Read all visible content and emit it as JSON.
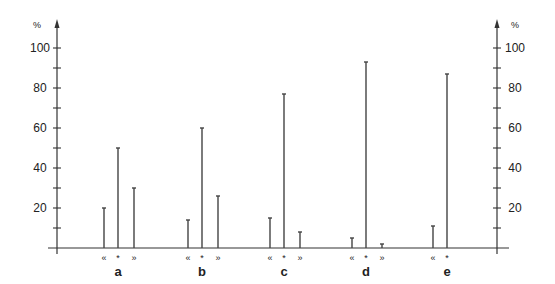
{
  "chart_data": {
    "type": "bar",
    "title": "",
    "xlabel": "",
    "ylabel": "%",
    "ylabel_right": "%",
    "ylim": [
      0,
      100
    ],
    "yticks_labeled": [
      20,
      40,
      60,
      80,
      100
    ],
    "yticks_minor": [
      10,
      30,
      50,
      70,
      90
    ],
    "grid": false,
    "legend": "none",
    "categories": [
      "a",
      "b",
      "c",
      "d",
      "e"
    ],
    "subcategory_markers": [
      "«",
      "*",
      "»"
    ],
    "series": [
      {
        "name": "«",
        "values": [
          20,
          14,
          15,
          5,
          11
        ]
      },
      {
        "name": "*",
        "values": [
          50,
          60,
          77,
          93,
          87
        ]
      },
      {
        "name": "»",
        "values": [
          30,
          26,
          8,
          2,
          null
        ]
      }
    ]
  },
  "axis": {
    "left_unit": "%",
    "right_unit": "%",
    "tick_labels": [
      "20",
      "40",
      "60",
      "80",
      "100"
    ]
  },
  "groups": [
    {
      "label": "a",
      "markers": [
        "«",
        "*",
        "»"
      ]
    },
    {
      "label": "b",
      "markers": [
        "«",
        "*",
        "»"
      ]
    },
    {
      "label": "c",
      "markers": [
        "«",
        "*",
        "»"
      ]
    },
    {
      "label": "d",
      "markers": [
        "«",
        "*",
        "»"
      ]
    },
    {
      "label": "e",
      "markers": [
        "«",
        "*"
      ]
    }
  ]
}
